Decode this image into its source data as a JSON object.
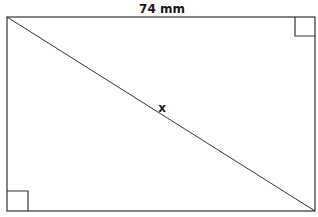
{
  "diagram": {
    "type": "rectangle-with-diagonal",
    "top_label": "74 mm",
    "diagonal_label": "x",
    "right_angle_markers": [
      "top-right",
      "bottom-left"
    ],
    "stroke_color": "#333333",
    "background": "#ffffff"
  }
}
